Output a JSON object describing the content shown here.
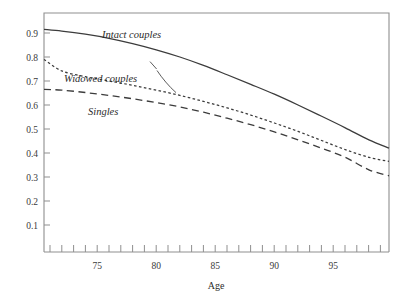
{
  "chart_data": {
    "type": "line",
    "title": "",
    "xlabel": "Age",
    "ylabel": "",
    "xlim": [
      70.5,
      99.7
    ],
    "ylim": [
      0.0,
      1.0
    ],
    "grid": false,
    "legend_position": "inline-annotations",
    "x_ticks_labeled": [
      "75",
      "80",
      "85",
      "90",
      "95"
    ],
    "x_tick_values": [
      75,
      80,
      85,
      90,
      95
    ],
    "x_minor_tick_values": [
      71,
      72,
      73,
      74,
      75,
      76,
      77,
      78,
      79,
      80,
      81,
      82,
      83,
      84,
      85,
      86,
      87,
      88,
      89,
      90,
      91,
      92,
      93,
      94,
      95,
      96,
      97,
      98,
      99
    ],
    "y_ticks_labeled": [
      "0.1",
      "0.2",
      "0.3",
      "0.4",
      "0.5",
      "0.6",
      "0.7",
      "0.8",
      "0.9"
    ],
    "y_tick_values": [
      0.1,
      0.2,
      0.3,
      0.4,
      0.5,
      0.6,
      0.7,
      0.8,
      0.9
    ],
    "x": [
      70.5,
      72,
      74,
      76,
      78,
      80,
      82,
      84,
      86,
      88,
      90,
      92,
      94,
      96,
      98,
      99.7
    ],
    "series": [
      {
        "name": "Intact couples",
        "style": "solid",
        "color": "#3c3c3c",
        "values": [
          0.915,
          0.908,
          0.895,
          0.878,
          0.856,
          0.83,
          0.8,
          0.765,
          0.726,
          0.686,
          0.645,
          0.6,
          0.553,
          0.505,
          0.455,
          0.42
        ]
      },
      {
        "name": "Widowed couples",
        "style": "dotted",
        "color": "#3c3c3c",
        "values": [
          0.79,
          0.742,
          0.718,
          0.7,
          0.682,
          0.662,
          0.64,
          0.615,
          0.588,
          0.558,
          0.525,
          0.49,
          0.452,
          0.414,
          0.382,
          0.365
        ]
      },
      {
        "name": "Singles",
        "style": "dashed",
        "color": "#3c3c3c",
        "values": [
          0.665,
          0.662,
          0.652,
          0.64,
          0.626,
          0.61,
          0.592,
          0.57,
          0.545,
          0.518,
          0.488,
          0.455,
          0.42,
          0.382,
          0.33,
          0.305
        ]
      }
    ],
    "annotations": [
      {
        "text": "Intact couples",
        "x": 76.8,
        "y": 0.885,
        "italic": true
      },
      {
        "text": "Widowed couples",
        "x": 72.6,
        "y": 0.722,
        "italic": true
      },
      {
        "text": "Singles",
        "x": 74.6,
        "y": 0.598,
        "italic": true
      }
    ]
  },
  "axes": {
    "x_title": "Age",
    "y_labels": [
      "0.9",
      "0.8",
      "0.7",
      "0.6",
      "0.5",
      "0.4",
      "0.3",
      "0.2",
      "0.1"
    ],
    "x_labels": [
      "75",
      "80",
      "85",
      "90",
      "95"
    ]
  },
  "labels": {
    "intact": "Intact couples",
    "widowed": "Widowed couples",
    "singles": "Singles"
  }
}
